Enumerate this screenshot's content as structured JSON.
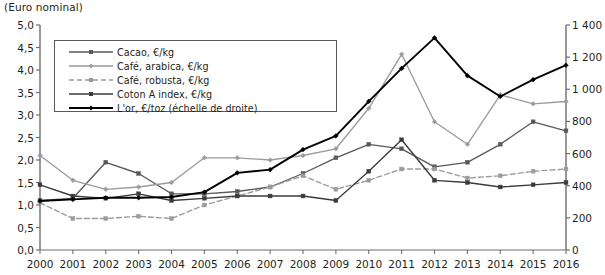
{
  "chart_data": {
    "type": "line",
    "title": "(Euro nominal)",
    "xlabel": "",
    "ylabel": "",
    "grid": false,
    "legend_position": "inside-top-left",
    "x": [
      2000,
      2001,
      2002,
      2003,
      2004,
      2005,
      2006,
      2007,
      2008,
      2009,
      2010,
      2011,
      2012,
      2013,
      2014,
      2015,
      2016
    ],
    "categories": [
      "2000",
      "2001",
      "2002",
      "2003",
      "2004",
      "2005",
      "2006",
      "2007",
      "2008",
      "2009",
      "2010",
      "2011",
      "2012",
      "2013",
      "2014",
      "2015",
      "2016"
    ],
    "left_axis": {
      "ylim": [
        0.0,
        5.0
      ],
      "ticks": [
        "0,0",
        "0,5",
        "1,0",
        "1,5",
        "2,0",
        "2,5",
        "3,0",
        "3,5",
        "4,0",
        "4,5",
        "5,0"
      ],
      "step": 0.5
    },
    "right_axis": {
      "ylim": [
        0,
        1400
      ],
      "ticks": [
        "0",
        "200",
        "400",
        "600",
        "800",
        "1 000",
        "1 200",
        "1 400"
      ],
      "step": 200,
      "note": "échelle de droite"
    },
    "series": [
      {
        "name": "Cacao, €/kg",
        "axis": "left",
        "color": "#58595b",
        "marker": "square",
        "dash": false,
        "values": [
          1.1,
          1.15,
          1.95,
          1.7,
          1.25,
          1.25,
          1.3,
          1.4,
          1.7,
          2.05,
          2.35,
          2.25,
          1.85,
          1.95,
          2.35,
          2.85,
          2.65
        ]
      },
      {
        "name": "Café, arabica, €/kg",
        "axis": "left",
        "color": "#9a9b9e",
        "marker": "diamond",
        "dash": false,
        "values": [
          2.1,
          1.55,
          1.35,
          1.4,
          1.5,
          2.05,
          2.05,
          2.0,
          2.1,
          2.25,
          3.15,
          4.35,
          2.85,
          2.35,
          3.45,
          3.25,
          3.3
        ]
      },
      {
        "name": "Café, robusta, €/kg",
        "axis": "left",
        "color": "#9a9b9e",
        "marker": "square",
        "dash": true,
        "values": [
          1.05,
          0.7,
          0.7,
          0.75,
          0.7,
          1.0,
          1.2,
          1.4,
          1.65,
          1.35,
          1.55,
          1.8,
          1.8,
          1.6,
          1.65,
          1.75,
          1.8
        ]
      },
      {
        "name": "Coton A index, €/kg",
        "axis": "left",
        "color": "#3b3b3d",
        "marker": "square",
        "dash": false,
        "values": [
          1.45,
          1.2,
          1.15,
          1.25,
          1.1,
          1.15,
          1.2,
          1.2,
          1.2,
          1.1,
          1.75,
          2.45,
          1.55,
          1.5,
          1.4,
          1.45,
          1.5
        ]
      },
      {
        "name": "L'or, €/toz (échelle de droite)",
        "axis": "right",
        "color": "#000000",
        "marker": "diamond",
        "dash": false,
        "values": [
          305,
          315,
          325,
          325,
          330,
          360,
          480,
          500,
          625,
          710,
          925,
          1130,
          1320,
          1085,
          955,
          1060,
          1150
        ]
      }
    ]
  },
  "legend": {
    "items": [
      {
        "label": "Cacao, €/kg"
      },
      {
        "label": "Café, arabica, €/kg"
      },
      {
        "label": "Café, robusta, €/kg"
      },
      {
        "label": "Coton A index, €/kg"
      },
      {
        "label": "L'or, €/toz (échelle de droite)"
      }
    ]
  },
  "colors": {
    "cacao": "#58595b",
    "arabica": "#9a9b9e",
    "robusta": "#9a9b9e",
    "coton": "#3b3b3d",
    "gold": "#000000",
    "axis": "#6d6e70",
    "text": "#231f20"
  }
}
